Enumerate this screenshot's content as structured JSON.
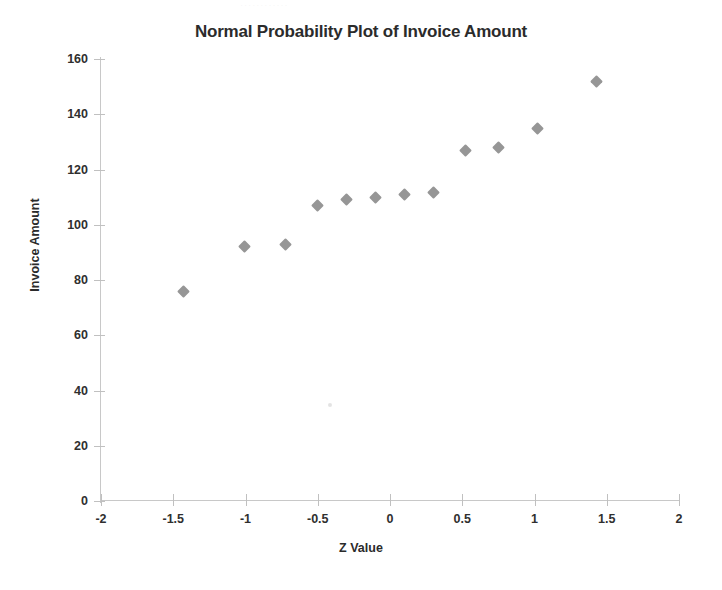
{
  "page": {
    "background_color": "#ffffff",
    "clipped_header_text": "............"
  },
  "chart_data": {
    "type": "scatter",
    "title": "Normal Probability Plot of Invoice Amount",
    "xlabel": "Z Value",
    "ylabel": "Invoice Amount",
    "xlim": [
      -2,
      2
    ],
    "ylim": [
      0,
      160
    ],
    "xticks": [
      -2,
      -1.5,
      -1,
      -0.5,
      0,
      0.5,
      1,
      1.5,
      2
    ],
    "xtick_labels": [
      "-2",
      "-1.5",
      "-1",
      "-0.5",
      "0",
      "0.5",
      "1",
      "1.5",
      "2"
    ],
    "yticks": [
      0,
      20,
      40,
      60,
      80,
      100,
      120,
      140,
      160
    ],
    "ytick_labels": [
      "0",
      "20",
      "40",
      "60",
      "80",
      "100",
      "120",
      "140",
      "160"
    ],
    "grid": false,
    "legend": false,
    "marker_shape": "diamond",
    "marker_color": "#969696",
    "axis_color": "#c8c8c8",
    "series": [
      {
        "name": "Invoice Amount",
        "x": [
          -1.43,
          -1.01,
          -0.72,
          -0.5,
          -0.3,
          -0.1,
          0.1,
          0.3,
          0.52,
          0.75,
          1.02,
          1.43
        ],
        "y": [
          76,
          92,
          93,
          107,
          109,
          110,
          111,
          111.5,
          127,
          128,
          135,
          152
        ]
      }
    ]
  }
}
